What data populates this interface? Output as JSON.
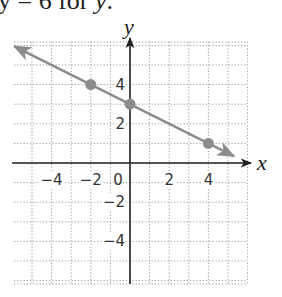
{
  "caption": {
    "prefix": "y = 6 for ",
    "variable": "y",
    "suffix": "."
  },
  "chart_data": {
    "type": "line",
    "title": "",
    "xlabel": "x",
    "ylabel": "y",
    "xlim": [
      -6,
      6
    ],
    "ylim": [
      -6,
      6
    ],
    "grid": true,
    "grid_style": "dotted",
    "x_tick_labels": [
      "-4",
      "-2",
      "0",
      "2",
      "4"
    ],
    "y_tick_labels": [
      "4",
      "2",
      "-2",
      "-4"
    ],
    "line": {
      "slope": -0.5,
      "intercept": 3,
      "equation": "y = -x/2 + 3",
      "color": "#8c8c8c",
      "arrows": "both"
    },
    "points": [
      {
        "x": -2,
        "y": 4
      },
      {
        "x": 0,
        "y": 3
      },
      {
        "x": 4,
        "y": 1
      }
    ]
  },
  "colors": {
    "line": "#8c8c8c",
    "axis": "#222222",
    "grid": "#9a9a9a"
  }
}
